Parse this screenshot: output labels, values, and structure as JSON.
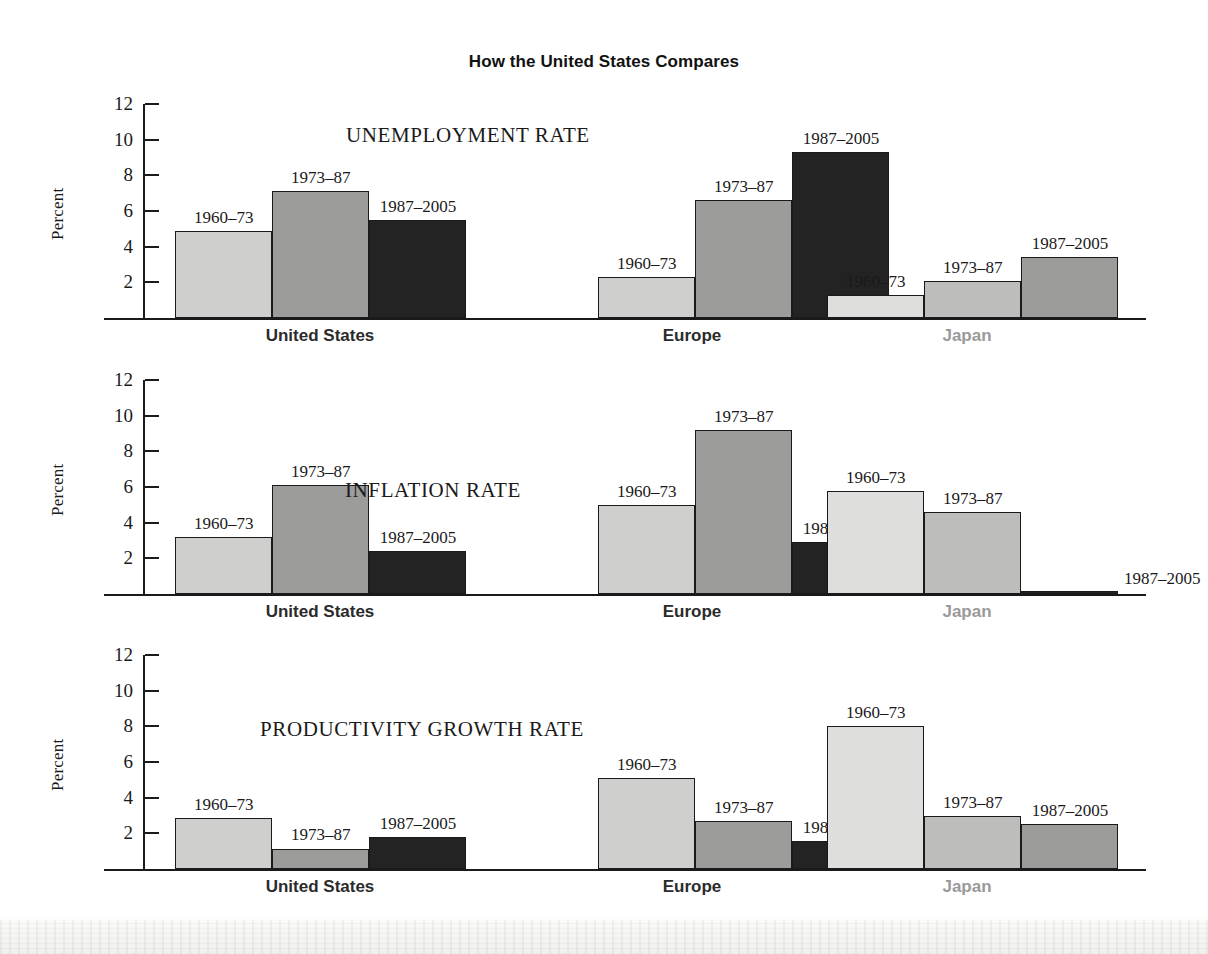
{
  "figure": {
    "title": "How the United States Compares",
    "y_axis_label": "Percent",
    "y_ticks": [
      "12",
      "10",
      "8",
      "6",
      "4",
      "2"
    ],
    "groups": [
      {
        "name": "United States",
        "tone": "dark"
      },
      {
        "name": "Europe",
        "tone": "dark"
      },
      {
        "name": "Japan",
        "tone": "gray"
      }
    ],
    "periods": [
      "1960–73",
      "1973–87",
      "1987–2005"
    ]
  },
  "panels": [
    {
      "id": "unemployment",
      "title": "UNEMPLOYMENT RATE",
      "groups": [
        {
          "name": "United States",
          "bars": [
            {
              "period": "1960–73",
              "value": 4.9,
              "shade": "light"
            },
            {
              "period": "1973–87",
              "value": 7.1,
              "shade": "med"
            },
            {
              "period": "1987–2005",
              "value": 5.5,
              "shade": "black"
            }
          ]
        },
        {
          "name": "Europe",
          "bars": [
            {
              "period": "1960–73",
              "value": 2.3,
              "shade": "light"
            },
            {
              "period": "1973–87",
              "value": 6.6,
              "shade": "med"
            },
            {
              "period": "1987–2005",
              "value": 9.3,
              "shade": "black"
            }
          ]
        },
        {
          "name": "Japan",
          "bars": [
            {
              "period": "1960–73",
              "value": 1.3,
              "shade": "xlight"
            },
            {
              "period": "1973–87",
              "value": 2.1,
              "shade": "mlight"
            },
            {
              "period": "1987–2005",
              "value": 3.4,
              "shade": "med"
            }
          ]
        }
      ]
    },
    {
      "id": "inflation",
      "title": "INFLATION RATE",
      "groups": [
        {
          "name": "United States",
          "bars": [
            {
              "period": "1960–73",
              "value": 3.2,
              "shade": "light"
            },
            {
              "period": "1973–87",
              "value": 6.1,
              "shade": "med"
            },
            {
              "period": "1987–2005",
              "value": 2.4,
              "shade": "black"
            }
          ]
        },
        {
          "name": "Europe",
          "bars": [
            {
              "period": "1960–73",
              "value": 5.0,
              "shade": "light"
            },
            {
              "period": "1973–87",
              "value": 9.2,
              "shade": "med"
            },
            {
              "period": "1987–2005",
              "value": 2.9,
              "shade": "black"
            }
          ]
        },
        {
          "name": "Japan",
          "bars": [
            {
              "period": "1960–73",
              "value": 5.8,
              "shade": "xlight"
            },
            {
              "period": "1973–87",
              "value": 4.6,
              "shade": "mlight"
            },
            {
              "period": "1987–2005",
              "value": 0.1,
              "shade": "black"
            }
          ]
        }
      ]
    },
    {
      "id": "productivity",
      "title": "PRODUCTIVITY GROWTH RATE",
      "groups": [
        {
          "name": "United States",
          "bars": [
            {
              "period": "1960–73",
              "value": 2.85,
              "shade": "light"
            },
            {
              "period": "1973–87",
              "value": 1.15,
              "shade": "med"
            },
            {
              "period": "1987–2005",
              "value": 1.8,
              "shade": "black"
            }
          ]
        },
        {
          "name": "Europe",
          "bars": [
            {
              "period": "1960–73",
              "value": 5.1,
              "shade": "light"
            },
            {
              "period": "1973–87",
              "value": 2.7,
              "shade": "med"
            },
            {
              "period": "1987–2005",
              "value": 1.55,
              "shade": "black"
            }
          ]
        },
        {
          "name": "Japan",
          "bars": [
            {
              "period": "1960–73",
              "value": 8.0,
              "shade": "xlight"
            },
            {
              "period": "1973–87",
              "value": 3.0,
              "shade": "mlight"
            },
            {
              "period": "1987–2005",
              "value": 2.5,
              "shade": "med"
            }
          ]
        }
      ]
    }
  ],
  "chart_data": {
    "type": "bar",
    "title": "How the United States Compares",
    "xlabel": "",
    "ylabel": "Percent",
    "ylim": [
      0,
      12
    ],
    "yticks": [
      2,
      4,
      6,
      8,
      10,
      12
    ],
    "grid": false,
    "legend": "none (bars labeled in place)",
    "categories": [
      "United States",
      "Europe",
      "Japan"
    ],
    "series": [
      {
        "name": "1960–73",
        "panel": "UNEMPLOYMENT RATE",
        "values": [
          4.9,
          2.3,
          1.3
        ]
      },
      {
        "name": "1973–87",
        "panel": "UNEMPLOYMENT RATE",
        "values": [
          7.1,
          6.6,
          2.1
        ]
      },
      {
        "name": "1987–2005",
        "panel": "UNEMPLOYMENT RATE",
        "values": [
          5.5,
          9.3,
          3.4
        ]
      },
      {
        "name": "1960–73",
        "panel": "INFLATION RATE",
        "values": [
          3.2,
          5.0,
          5.8
        ]
      },
      {
        "name": "1973–87",
        "panel": "INFLATION RATE",
        "values": [
          6.1,
          9.2,
          4.6
        ]
      },
      {
        "name": "1987–2005",
        "panel": "INFLATION RATE",
        "values": [
          2.4,
          2.9,
          0.1
        ]
      },
      {
        "name": "1960–73",
        "panel": "PRODUCTIVITY GROWTH RATE",
        "values": [
          2.85,
          5.1,
          8.0
        ]
      },
      {
        "name": "1973–87",
        "panel": "PRODUCTIVITY GROWTH RATE",
        "values": [
          1.15,
          2.7,
          3.0
        ]
      },
      {
        "name": "1987–2005",
        "panel": "PRODUCTIVITY GROWTH RATE",
        "values": [
          1.8,
          1.55,
          2.5
        ]
      }
    ],
    "panels": [
      "UNEMPLOYMENT RATE",
      "INFLATION RATE",
      "PRODUCTIVITY GROWTH RATE"
    ]
  }
}
